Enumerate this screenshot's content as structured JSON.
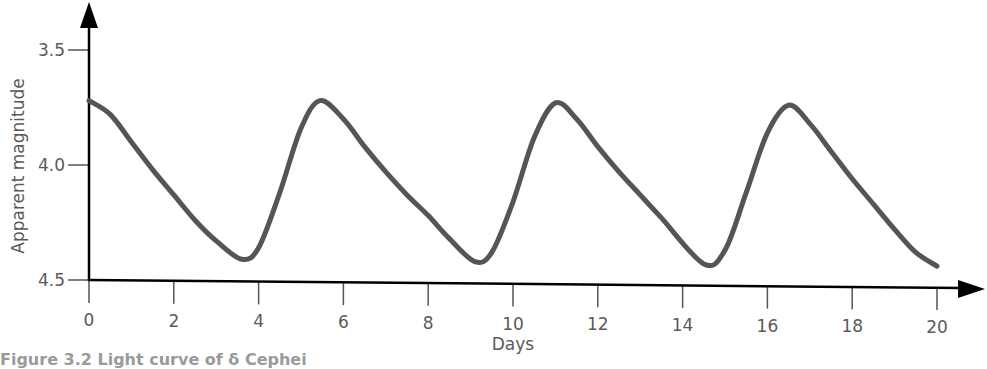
{
  "chart_data": {
    "type": "line",
    "title": "",
    "xlabel": "Days",
    "ylabel": "Apparent magnitude",
    "xlim": [
      0,
      20
    ],
    "ylim": [
      4.5,
      3.5
    ],
    "y_inverted": true,
    "x_ticks": [
      "0",
      "2",
      "4",
      "6",
      "8",
      "10",
      "12",
      "14",
      "16",
      "18",
      "20"
    ],
    "y_ticks": [
      "3.5",
      "4.0",
      "4.5"
    ],
    "grid": false,
    "legend": null,
    "line_color": "#555555",
    "series": [
      {
        "name": "light curve",
        "x": [
          0,
          0.5,
          1.0,
          1.5,
          2.0,
          2.5,
          3.0,
          3.6,
          4.0,
          4.5,
          5.0,
          5.45,
          6.0,
          6.5,
          7.0,
          7.5,
          8.0,
          8.5,
          9.1,
          9.5,
          10.0,
          10.5,
          11.0,
          11.5,
          12.0,
          12.5,
          13.0,
          13.5,
          14.5,
          15.0,
          15.5,
          16.0,
          16.5,
          17.0,
          17.5,
          18.0,
          18.5,
          19.0,
          19.5,
          20.0
        ],
        "values": [
          3.72,
          3.78,
          3.9,
          4.02,
          4.13,
          4.24,
          4.33,
          4.41,
          4.36,
          4.12,
          3.84,
          3.72,
          3.8,
          3.92,
          4.03,
          4.13,
          4.22,
          4.32,
          4.42,
          4.38,
          4.16,
          3.88,
          3.73,
          3.8,
          3.92,
          4.03,
          4.13,
          4.23,
          4.43,
          4.37,
          4.12,
          3.86,
          3.74,
          3.82,
          3.94,
          4.06,
          4.17,
          4.28,
          4.38,
          4.44
        ]
      }
    ],
    "annotations": {
      "maxima": [
        {
          "day": 0,
          "mag": 3.72
        },
        {
          "day": 5.45,
          "mag": 3.72
        },
        {
          "day": 11.0,
          "mag": 3.73
        },
        {
          "day": 16.5,
          "mag": 3.74
        }
      ],
      "minima": [
        {
          "day": 3.6,
          "mag": 4.41
        },
        {
          "day": 9.1,
          "mag": 4.42
        },
        {
          "day": 14.5,
          "mag": 4.43
        }
      ],
      "approx_period_days": 5.4
    }
  },
  "caption": "Figure 3.2 Light curve of δ Cephei"
}
